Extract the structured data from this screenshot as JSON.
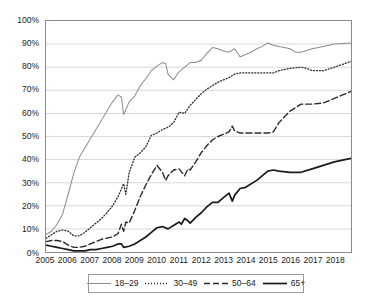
{
  "chart_data": {
    "type": "line",
    "title": "",
    "subtitle": "",
    "xlabel": "",
    "ylabel": "",
    "xlim": [
      2005,
      2018.75
    ],
    "ylim": [
      0,
      100
    ],
    "grid": true,
    "legend_position": "bottom",
    "y_ticks": [
      "0%",
      "10%",
      "20%",
      "30%",
      "40%",
      "50%",
      "60%",
      "70%",
      "80%",
      "90%",
      "100%"
    ],
    "y_tick_values": [
      0,
      10,
      20,
      30,
      40,
      50,
      60,
      70,
      80,
      90,
      100
    ],
    "x_ticks": [
      "2005",
      "2006",
      "2007",
      "2008",
      "2009",
      "2010",
      "2011",
      "2012",
      "2013",
      "2014",
      "2015",
      "2016",
      "2017",
      "2018"
    ],
    "x_tick_values": [
      2005,
      2006,
      2007,
      2008,
      2009,
      2010,
      2011,
      2012,
      2013,
      2014,
      2015,
      2016,
      2017,
      2018
    ],
    "series": [
      {
        "name": "18–29",
        "style": "solid-light",
        "color": "#8c8c8c",
        "width": 1,
        "x": [
          2005.0,
          2005.25,
          2005.5,
          2005.75,
          2006.0,
          2006.25,
          2006.5,
          2006.75,
          2007.0,
          2007.25,
          2007.5,
          2007.75,
          2008.0,
          2008.25,
          2008.4,
          2008.5,
          2008.75,
          2009.0,
          2009.25,
          2009.5,
          2009.75,
          2010.0,
          2010.25,
          2010.4,
          2010.5,
          2010.75,
          2011.0,
          2011.25,
          2011.5,
          2011.75,
          2012.0,
          2012.25,
          2012.5,
          2012.75,
          2013.0,
          2013.25,
          2013.5,
          2013.75,
          2014.0,
          2014.25,
          2014.5,
          2014.75,
          2015.0,
          2015.25,
          2015.5,
          2015.75,
          2016.0,
          2016.25,
          2016.5,
          2017.0,
          2017.5,
          2018.0,
          2018.75
        ],
        "y": [
          7.5,
          9.0,
          12.0,
          16.5,
          25.0,
          34.0,
          41.0,
          45.0,
          49.0,
          53.0,
          57.0,
          61.0,
          65.0,
          68.0,
          67.0,
          59.5,
          65.0,
          67.5,
          72.0,
          75.0,
          78.5,
          80.5,
          82.0,
          81.5,
          77.0,
          74.5,
          78.0,
          80.0,
          82.0,
          82.0,
          83.0,
          86.0,
          88.5,
          88.0,
          87.0,
          86.5,
          88.0,
          84.5,
          85.5,
          86.5,
          88.0,
          89.0,
          90.5,
          89.5,
          89.0,
          88.5,
          88.0,
          86.5,
          86.5,
          88.0,
          89.0,
          90.0,
          90.5
        ]
      },
      {
        "name": "30–49",
        "style": "dotted",
        "color": "#2b2b2b",
        "width": 1.3,
        "x": [
          2005.0,
          2005.25,
          2005.5,
          2005.75,
          2006.0,
          2006.25,
          2006.5,
          2006.75,
          2007.0,
          2007.25,
          2007.5,
          2007.75,
          2008.0,
          2008.25,
          2008.5,
          2008.6,
          2008.75,
          2009.0,
          2009.25,
          2009.5,
          2009.75,
          2010.0,
          2010.25,
          2010.5,
          2010.75,
          2011.0,
          2011.25,
          2011.5,
          2011.75,
          2012.0,
          2012.25,
          2012.5,
          2012.75,
          2013.0,
          2013.25,
          2013.5,
          2013.75,
          2014.0,
          2014.5,
          2015.0,
          2015.25,
          2015.5,
          2016.0,
          2016.5,
          2016.75,
          2017.0,
          2017.5,
          2018.0,
          2018.75
        ],
        "y": [
          6.0,
          7.5,
          9.0,
          9.5,
          9.0,
          7.0,
          7.0,
          8.5,
          10.5,
          12.5,
          14.5,
          17.0,
          20.0,
          24.0,
          29.5,
          25.0,
          34.5,
          41.0,
          43.0,
          45.5,
          50.5,
          51.5,
          53.0,
          54.0,
          56.0,
          60.5,
          60.0,
          63.5,
          66.0,
          68.5,
          70.5,
          72.0,
          73.5,
          74.5,
          75.5,
          77.0,
          77.5,
          77.5,
          77.5,
          77.5,
          77.5,
          78.5,
          79.5,
          80.0,
          79.5,
          78.5,
          78.5,
          80.0,
          82.5
        ]
      },
      {
        "name": "50–64",
        "style": "dashed",
        "color": "#2b2b2b",
        "width": 1.4,
        "x": [
          2005.0,
          2005.25,
          2005.5,
          2005.75,
          2006.0,
          2006.25,
          2006.5,
          2006.75,
          2007.0,
          2007.25,
          2007.5,
          2007.75,
          2008.0,
          2008.25,
          2008.4,
          2008.5,
          2008.6,
          2008.75,
          2009.0,
          2009.25,
          2009.5,
          2009.75,
          2010.0,
          2010.25,
          2010.4,
          2010.5,
          2010.75,
          2011.0,
          2011.25,
          2011.4,
          2011.5,
          2011.75,
          2012.0,
          2012.25,
          2012.5,
          2012.75,
          2013.0,
          2013.25,
          2013.4,
          2013.5,
          2013.75,
          2014.0,
          2014.5,
          2015.0,
          2015.25,
          2015.5,
          2016.0,
          2016.5,
          2017.0,
          2017.5,
          2018.0,
          2018.75
        ],
        "y": [
          4.5,
          5.0,
          5.0,
          4.5,
          3.0,
          2.0,
          2.0,
          2.5,
          3.5,
          4.5,
          5.5,
          6.0,
          6.5,
          8.0,
          12.0,
          9.0,
          13.0,
          12.5,
          18.0,
          24.0,
          29.0,
          33.5,
          37.5,
          34.5,
          31.0,
          33.0,
          35.5,
          36.0,
          33.0,
          36.0,
          35.5,
          39.0,
          43.0,
          46.0,
          48.5,
          50.0,
          51.0,
          52.0,
          54.5,
          52.5,
          51.5,
          51.5,
          51.5,
          51.5,
          52.0,
          56.0,
          61.0,
          64.0,
          64.0,
          64.5,
          66.5,
          69.5
        ]
      },
      {
        "name": "65+",
        "style": "solid-dark",
        "color": "#1a1a1a",
        "width": 1.7,
        "x": [
          2005.0,
          2005.25,
          2005.5,
          2005.75,
          2006.0,
          2006.25,
          2006.5,
          2006.75,
          2007.0,
          2007.25,
          2007.5,
          2007.75,
          2008.0,
          2008.25,
          2008.4,
          2008.5,
          2008.75,
          2009.0,
          2009.25,
          2009.5,
          2009.75,
          2010.0,
          2010.25,
          2010.5,
          2010.75,
          2011.0,
          2011.1,
          2011.25,
          2011.4,
          2011.5,
          2011.75,
          2012.0,
          2012.25,
          2012.5,
          2012.75,
          2013.0,
          2013.25,
          2013.4,
          2013.5,
          2013.75,
          2014.0,
          2014.5,
          2015.0,
          2015.25,
          2015.5,
          2016.0,
          2016.5,
          2017.0,
          2017.5,
          2018.0,
          2018.75
        ],
        "y": [
          3.0,
          2.5,
          2.0,
          1.5,
          1.0,
          0.5,
          0.5,
          0.5,
          1.0,
          1.0,
          1.5,
          2.0,
          2.5,
          3.5,
          3.5,
          2.0,
          2.5,
          3.5,
          5.0,
          6.5,
          8.5,
          10.5,
          11.0,
          10.0,
          11.5,
          13.0,
          12.0,
          14.5,
          13.5,
          12.5,
          15.0,
          17.0,
          19.5,
          21.5,
          21.5,
          23.5,
          25.5,
          22.0,
          24.5,
          27.5,
          28.0,
          31.0,
          35.0,
          35.5,
          35.0,
          34.5,
          34.5,
          36.0,
          37.5,
          39.0,
          40.5
        ]
      }
    ]
  }
}
